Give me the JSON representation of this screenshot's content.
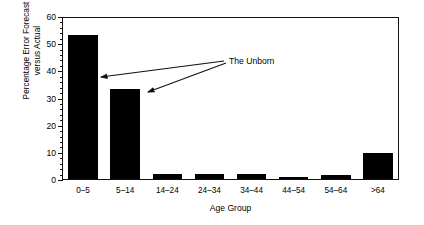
{
  "chart_data": {
    "type": "bar",
    "title": "",
    "xlabel": "Age Group",
    "ylabel": "Percentage Error Forecast versus Actual",
    "ylabel_line1": "Percentage Error Forecast",
    "ylabel_line2": "versus Actual",
    "categories": [
      "0–5",
      "5–14",
      "14–24",
      "24–34",
      "34–44",
      "44–54",
      "54–64",
      ">64"
    ],
    "values": [
      53,
      33,
      2,
      2,
      2,
      0.7,
      1.5,
      9.5
    ],
    "ylim": [
      0,
      60
    ],
    "yticks": [
      0,
      10,
      20,
      30,
      40,
      50,
      60
    ],
    "ytick_labels": [
      "0",
      "10",
      "20",
      "30",
      "40",
      "50",
      "60"
    ],
    "yminor_step": 2,
    "grid": false,
    "legend": "none",
    "bar_color": "#000000",
    "annotations": [
      {
        "text": "The Unborn",
        "targets": [
          "0–5",
          "5–14"
        ]
      }
    ]
  }
}
